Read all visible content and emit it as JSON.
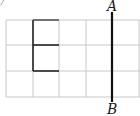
{
  "figure": {
    "corner_fragment": "/",
    "label_top": "A",
    "label_bottom": "B",
    "grid": {
      "columns": 5,
      "rows": 3,
      "x_lines": [
        6,
        33,
        59,
        86,
        112,
        139
      ],
      "y_lines": [
        20,
        45,
        71,
        97
      ],
      "line_color": "#c8c8c8"
    },
    "bold_shape": {
      "description": "bracket shape: left edge of column 2 spanning rows 1-2 with top, middle and bottom horizontal segments",
      "color": "#222222"
    },
    "line_AB": {
      "x": 112,
      "y_top": 12,
      "y_bottom": 102,
      "color": "#111111"
    }
  }
}
